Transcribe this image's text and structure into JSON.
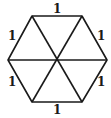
{
  "diagram": {
    "shape": "regular hexagon divided into 6 equilateral triangles",
    "vertices": {
      "top_left": [
        32,
        16
      ],
      "top_right": [
        82,
        16
      ],
      "right": [
        107,
        60
      ],
      "bottom_right": [
        82,
        102
      ],
      "bottom_left": [
        32,
        102
      ],
      "left": [
        8,
        60
      ],
      "center": [
        57,
        60
      ]
    },
    "edge_labels": {
      "top": "1",
      "upper_left": "1",
      "upper_right": "1",
      "lower_left": "1",
      "lower_right": "1",
      "bottom": "1"
    },
    "stroke_color": "#1a1a1a",
    "background": "#ffffff"
  }
}
